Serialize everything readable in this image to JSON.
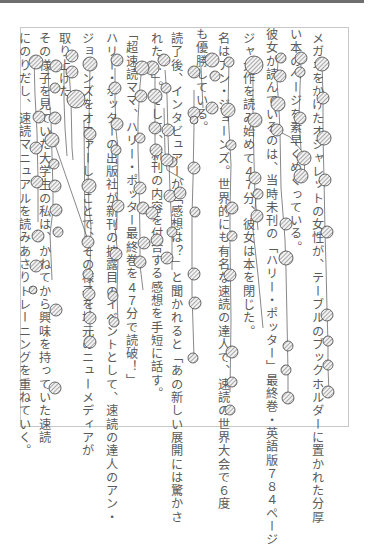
{
  "document": {
    "type": "scanned-japanese-vertical-text-with-gaze-overlay",
    "columns": [
      {
        "x": 316,
        "y": 30,
        "text": "メガネをかけたオシャレットの女性が、テーブルのブックホルダーに置かれた分厚"
      },
      {
        "x": 294,
        "y": 26,
        "text": "い本のページを素早くめくっている。"
      },
      {
        "x": 270,
        "y": 26,
        "text": "彼女が読んでいるのは、当時未刊の「ハリー・ポッター」最終巻・英語版７８４ページ"
      },
      {
        "x": 247,
        "y": 30,
        "text": "ジャ大作を読み始めて４７分、彼女は本を閉じた。"
      },
      {
        "x": 222,
        "y": 30,
        "text": "名はアン・ジョーンズ。世界的にも有名な速読の達人で、速読の世界大会で６度"
      },
      {
        "x": 200,
        "y": 26,
        "text": "も優勝している。"
      },
      {
        "x": 175,
        "y": 30,
        "text": "読了後、インタビュアーが「感想は？」と聞かれると「あの新しい展開には驚かさ"
      },
      {
        "x": 155,
        "y": 30,
        "text": "れた…」。そして、新刊の内容を付合する感想を手短に話す。"
      },
      {
        "x": 130,
        "y": 26,
        "text": "「超速読ママ、ハリー・ポッター最終巻を４７分で読破！」"
      },
      {
        "x": 110,
        "y": 30,
        "text": "ハリー・ポッターの出版社が新刊の披露目のイベントとして、速読の達人のアン・"
      },
      {
        "x": 86,
        "y": 30,
        "text": "ジョーンズをオファーしたことで、その様子を地元のニューメディアが"
      },
      {
        "x": 62,
        "y": 30,
        "text": "取り上げた。"
      },
      {
        "x": 43,
        "y": 30,
        "text": "その様子を見ていた大学生の私は、かねてから興味を持っていた速読"
      }
    ],
    "extra_column": {
      "x": 22,
      "y": 30,
      "text": "にのりだし、速読マニュアルを読みあさりトレーニングを重ねていく。"
    },
    "overlay": {
      "type": "eye-tracking-fixations",
      "fixation_fill": "hatched gray",
      "stroke_color": "#555555"
    }
  }
}
